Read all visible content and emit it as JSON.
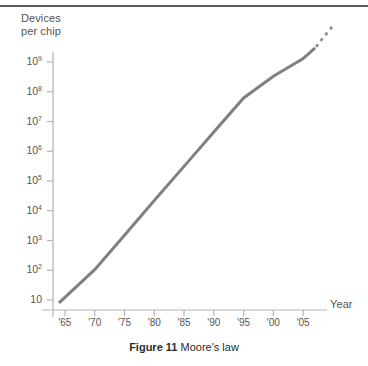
{
  "figure": {
    "caption_label": "Figure 11",
    "caption_text": "Moore's law",
    "top_rule": "horizontal-rule"
  },
  "chart_data": {
    "type": "line",
    "title": "",
    "subtitle": "",
    "xlabel": "Year",
    "ylabel": "Devices per chip",
    "ylabel_line1": "Devices",
    "ylabel_line2": "per chip",
    "yscale": "log",
    "grid": false,
    "legend": "none",
    "xlim": [
      1963,
      2009
    ],
    "ylim": [
      10,
      2000000000
    ],
    "xticks": [
      1965,
      1970,
      1975,
      1980,
      1985,
      1990,
      1995,
      2000,
      2005
    ],
    "xtick_labels": [
      "'65",
      "'70",
      "'75",
      "'80",
      "'85",
      "'90",
      "'95",
      "'00",
      "'05"
    ],
    "yticks": [
      10,
      100,
      1000,
      10000,
      100000,
      1000000,
      10000000,
      100000000,
      1000000000
    ],
    "ytick_labels": [
      "10",
      "10²",
      "10³",
      "10⁴",
      "10⁵",
      "10⁶",
      "10⁷",
      "10⁸",
      "10⁹"
    ],
    "ytick_mantissas": [
      "10",
      "10",
      "10",
      "10",
      "10",
      "10",
      "10",
      "10",
      "10"
    ],
    "ytick_exponents": [
      "",
      "2",
      "3",
      "4",
      "5",
      "6",
      "7",
      "8",
      "9"
    ],
    "series": [
      {
        "name": "Moore's law (historical)",
        "style": "solid",
        "color": "#808080",
        "width": 3,
        "x": [
          1964,
          1970,
          1975,
          1980,
          1985,
          1990,
          1995,
          2000,
          2005,
          2007
        ],
        "y": [
          8,
          105,
          1500,
          22000,
          310000,
          4400000,
          62000000,
          330000000,
          1300000000,
          3000000000
        ]
      },
      {
        "name": "Moore's law (projected)",
        "style": "dotted",
        "color": "#8c8c8c",
        "width": 3,
        "x": [
          2007.3,
          2007.9,
          2008.5,
          2009.1,
          2009.7
        ],
        "y": [
          3500000000,
          5000000000,
          7000000000,
          10000000000,
          14000000000
        ]
      }
    ],
    "annotations": []
  }
}
